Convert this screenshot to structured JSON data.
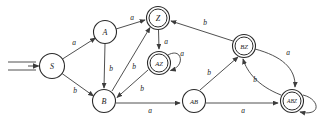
{
  "figure": {
    "name": "finite-state-machine-diagram",
    "background_color": "#ffffff",
    "stroke_color": "#3c3c3c",
    "node_stroke_color": "#2b2b2b",
    "label_color": "#1a1a1a",
    "width": 326,
    "height": 125
  },
  "start_marker": {
    "name": "start-arrow",
    "target": "S",
    "style": "double-line-arrow"
  },
  "states": [
    {
      "id": "S",
      "label": "S",
      "x": 52,
      "y": 66,
      "r": 12.5,
      "accepting": false,
      "start": true
    },
    {
      "id": "A",
      "label": "A",
      "x": 105,
      "y": 32,
      "r": 11.5,
      "accepting": false,
      "start": false
    },
    {
      "id": "B",
      "label": "B",
      "x": 104,
      "y": 101,
      "r": 11.5,
      "accepting": false,
      "start": false
    },
    {
      "id": "Z",
      "label": "Z",
      "x": 158,
      "y": 18,
      "r": 11.5,
      "accepting": true,
      "start": false
    },
    {
      "id": "AZ",
      "label": "AZ",
      "x": 159,
      "y": 63,
      "r": 11.5,
      "accepting": true,
      "start": false
    },
    {
      "id": "BZ",
      "label": "BZ",
      "x": 244,
      "y": 46,
      "r": 11.5,
      "accepting": true,
      "start": false
    },
    {
      "id": "AB",
      "label": "AB",
      "x": 194,
      "y": 101,
      "r": 11.5,
      "accepting": false,
      "start": false
    },
    {
      "id": "ABZ",
      "label": "ABZ",
      "x": 292,
      "y": 101,
      "r": 11.5,
      "accepting": true,
      "start": false
    }
  ],
  "transitions": [
    {
      "from": "S",
      "to": "A",
      "label": "a",
      "label_x": 74,
      "label_y": 42
    },
    {
      "from": "S",
      "to": "B",
      "label": "b",
      "label_x": 75,
      "label_y": 90
    },
    {
      "from": "A",
      "to": "Z",
      "label": "a",
      "label_x": 132,
      "label_y": 17
    },
    {
      "from": "A",
      "to": "B",
      "label": "b",
      "label_x": 111,
      "label_y": 68
    },
    {
      "from": "B",
      "to": "Z",
      "label": "b",
      "label_x": 134,
      "label_y": 66
    },
    {
      "from": "B",
      "to": "AB",
      "label": "a",
      "label_x": 150,
      "label_y": 110
    },
    {
      "from": "Z",
      "to": "AZ",
      "label": "a",
      "label_x": 166,
      "label_y": 41
    },
    {
      "from": "AZ",
      "to": "AZ",
      "label": "a",
      "label_x": 180,
      "label_y": 54,
      "self_loop": true
    },
    {
      "from": "AZ",
      "to": "B",
      "label": "b",
      "label_x": 142,
      "label_y": 88
    },
    {
      "from": "BZ",
      "to": "Z",
      "label": "b",
      "label_x": 205,
      "label_y": 22
    },
    {
      "from": "BZ",
      "to": "ABZ",
      "label": "a",
      "label_x": 288,
      "label_y": 52
    },
    {
      "from": "ABZ",
      "to": "BZ",
      "label": "b",
      "label_x": 255,
      "label_y": 79
    },
    {
      "from": "AB",
      "to": "BZ",
      "label": "b",
      "label_x": 209,
      "label_y": 72
    },
    {
      "from": "AB",
      "to": "ABZ",
      "label": "a",
      "label_x": 243,
      "label_y": 110
    },
    {
      "from": "ABZ",
      "to": "ABZ",
      "label": "",
      "label_x": 318,
      "label_y": 118,
      "self_loop": true
    }
  ]
}
